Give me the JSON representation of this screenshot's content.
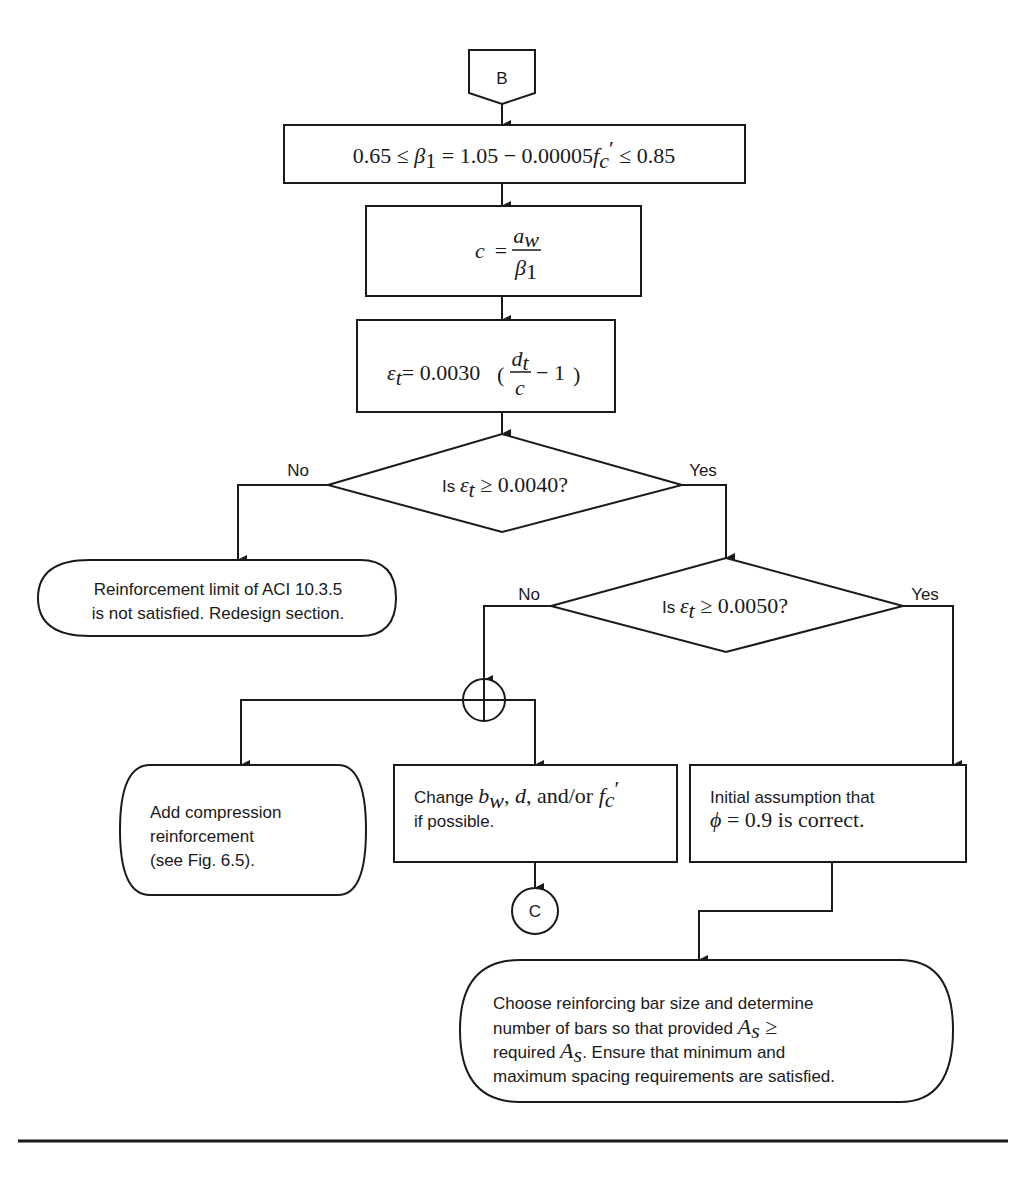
{
  "connectors": {
    "start": "B",
    "end": "C"
  },
  "steps": {
    "beta1": {
      "pre": "0.65 ≤ ",
      "var": "β",
      "sub": "1",
      "mid": " = 1.05 − 0.00005",
      "fvar": "f",
      "fsub": "c",
      "fprime": "′",
      "post": " ≤ 0.85"
    },
    "c_eq": {
      "lhs": "c",
      "eq": "=",
      "num_var": "a",
      "num_sub": "w",
      "den_var": "β",
      "den_sub": "1"
    },
    "strain_eq": {
      "lhs_var": "ε",
      "lhs_sub": "t",
      "coef": "= 0.0030",
      "num_var": "d",
      "num_sub": "t",
      "den_var": "c",
      "tail": "− 1"
    }
  },
  "decisions": {
    "d1": {
      "prefix": "Is ",
      "var": "ε",
      "sub": "t",
      "cond": " ≥ 0.0040?",
      "no_label": "No",
      "yes_label": "Yes"
    },
    "d2": {
      "prefix": "Is ",
      "var": "ε",
      "sub": "t",
      "cond": " ≥ 0.0050?",
      "no_label": "No",
      "yes_label": "Yes"
    }
  },
  "terminals": {
    "redesign": {
      "line1": "Reinforcement limit of ACI 10.3.5",
      "line2": "is not satisfied. Redesign section."
    },
    "compression": {
      "line1": "Add compression",
      "line2": "reinforcement",
      "line3": "(see Fig. 6.5)."
    },
    "choose_bars": {
      "line1": "Choose reinforcing bar size and determine",
      "line2_pre": "number of bars so that provided ",
      "line2_var": "A",
      "line2_sub": "s",
      "line2_post": " ≥",
      "line3_pre": "required ",
      "line3_var": "A",
      "line3_sub": "s",
      "line3_post": ". Ensure that minimum and",
      "line4": "maximum spacing requirements are satisfied."
    }
  },
  "processes": {
    "change_dims": {
      "line1_pre": "Change ",
      "b_var": "b",
      "b_sub": "w",
      "sep1": ", ",
      "d_var": "d",
      "andor": ", and/or ",
      "f_var": "f",
      "f_sub": "c",
      "f_prime": "′",
      "line2": "if possible."
    },
    "phi_ok": {
      "line1": "Initial assumption that",
      "phi": "ϕ",
      "line2_post": " = 0.9 is correct."
    }
  }
}
